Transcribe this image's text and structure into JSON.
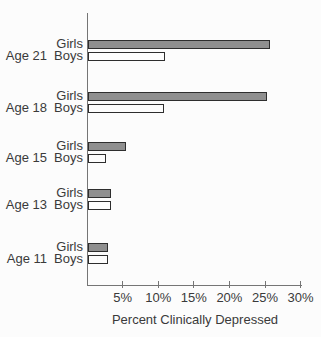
{
  "chart_data": {
    "type": "bar",
    "orientation": "horizontal",
    "title": "",
    "xlabel": "Percent Clinically Depressed",
    "ylabel": "",
    "xlim": [
      0,
      30
    ],
    "grid": false,
    "tick_labels": [
      "5%",
      "10%",
      "15%",
      "20%",
      "25%",
      "30%"
    ],
    "tick_values": [
      5,
      10,
      15,
      20,
      25,
      30
    ],
    "series_names": [
      "Girls",
      "Boys"
    ],
    "groups": [
      {
        "age": "Age 21",
        "girls_label": "Girls",
        "boys_label": "Boys",
        "girls": 25.3,
        "boys": 10.5
      },
      {
        "age": "Age 18",
        "girls_label": "Girls",
        "boys_label": "Boys",
        "girls": 24.8,
        "boys": 10.4
      },
      {
        "age": "Age 15",
        "girls_label": "Girls",
        "boys_label": "Boys",
        "girls": 5.0,
        "boys": 2.2
      },
      {
        "age": "Age 13",
        "girls_label": "Girls",
        "boys_label": "Boys",
        "girls": 2.9,
        "boys": 2.9
      },
      {
        "age": "Age 11",
        "girls_label": "Girls",
        "boys_label": "Boys",
        "girls": 2.5,
        "boys": 2.5
      }
    ],
    "colors": {
      "girls_fill": "#8f8f8f",
      "boys_fill": "#fdfdfd",
      "bar_border": "#2e2e2e",
      "axis": "#757575",
      "text": "#3a3a3a",
      "background": "#fcfcfc"
    }
  }
}
